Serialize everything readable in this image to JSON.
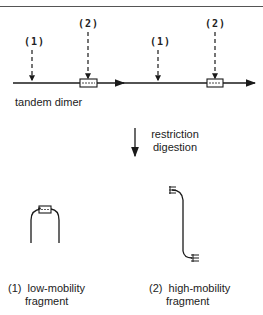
{
  "header": {
    "title_partial": ""
  },
  "diagram": {
    "top": {
      "site_labels": [
        "(1)",
        "(2)",
        "(1)",
        "(2)"
      ],
      "construct_label": "tandem dimer"
    },
    "step": {
      "label_line1": "restriction",
      "label_line2": "digestion"
    },
    "products": [
      {
        "number": "(1)",
        "name_line1": "low-mobility",
        "name_line2": "fragment"
      },
      {
        "number": "(2)",
        "name_line1": "high-mobility",
        "name_line2": "fragment"
      }
    ],
    "colors": {
      "ink": "#1a1a1a",
      "background": "#ffffff"
    }
  }
}
